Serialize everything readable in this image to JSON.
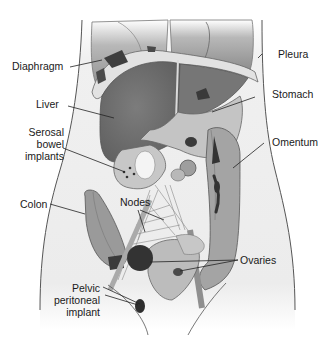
{
  "diagram": {
    "type": "anatomical-illustration",
    "colors": {
      "background": "#ffffff",
      "body_outline": "#555555",
      "body_fill": "#f1f1f1",
      "organ_light": "#bdbdbd",
      "organ_mid": "#9a9a9a",
      "organ_dark": "#6e6e6e",
      "implant": "#3a3a3a",
      "label_text": "#1a1a1a",
      "leader_line": "#222222"
    },
    "labels": {
      "diaphragm": "Diaphragm",
      "liver": "Liver",
      "serosal_bowel_implants": "Serosal\nbowel\nimplants",
      "colon": "Colon",
      "nodes": "Nodes",
      "pelvic_peritoneal_implant": "Pelvic\nperitoneal\nimplant",
      "pleura": "Pleura",
      "stomach": "Stomach",
      "omentum": "Omentum",
      "ovaries": "Ovaries"
    }
  }
}
